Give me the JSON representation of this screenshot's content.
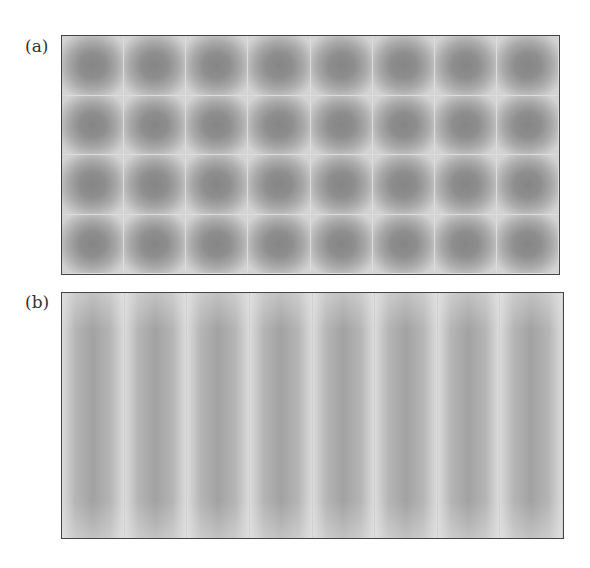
{
  "figure": {
    "panels": [
      {
        "label": "(a)",
        "rows": 4,
        "columns": 8,
        "pattern": "2D checkerboard of square domains",
        "colors": {
          "center": "#858585",
          "edge": "#d3d3d3",
          "border": "#444444"
        }
      },
      {
        "label": "(b)",
        "rows": 1,
        "columns": 8,
        "pattern": "1D vertical stripes",
        "colors": {
          "center": "#a2a2a2",
          "edge": "#dadada",
          "border": "#444444"
        }
      }
    ]
  }
}
